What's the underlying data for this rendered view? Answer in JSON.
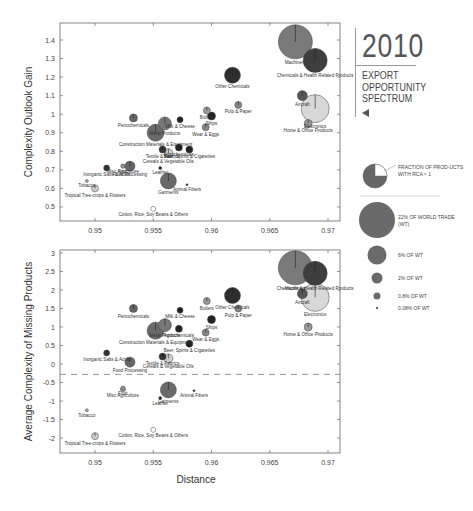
{
  "title": {
    "year": "2010",
    "lines": [
      "EXPORT",
      "OPPORTUNITY",
      "SPECTRUM"
    ]
  },
  "legend": {
    "fraction_label": "FRACTION OF PROD-UCTS WITH RCA > 1",
    "sizes": [
      {
        "label": "22% OF WORLD TRADE (WT)",
        "r": 18
      },
      {
        "label": "6% OF WT",
        "r": 9.5
      },
      {
        "label": "2% OF WT",
        "r": 5.5
      },
      {
        "label": "0.8% OF WT",
        "r": 3.5
      },
      {
        "label": "0.08% OF WT",
        "r": 1.2
      }
    ]
  },
  "chart_data": [
    {
      "type": "scatter",
      "title": "",
      "xlabel": "",
      "ylabel": "Complexity Outlook Gain",
      "xlim": [
        0.948,
        0.9712
      ],
      "ylim": [
        0.42,
        1.5
      ],
      "xticks": [
        "0.95",
        "0.955",
        "0.96",
        "0.965",
        "0.97"
      ],
      "yticks": [
        "0.5",
        "0.6",
        "0.7",
        "0.8",
        "0.9",
        "1",
        "1.1",
        "1.2",
        "1.3",
        "1.4"
      ],
      "points": [
        {
          "name": "Machinery",
          "x": 0.9672,
          "y": 1.39,
          "r": 17,
          "color": "#7a7a7a"
        },
        {
          "name": "Chemicals & Health Related Products",
          "x": 0.9689,
          "y": 1.29,
          "r": 12,
          "color": "#3e3e3e"
        },
        {
          "name": "Other Chemicals",
          "x": 0.9618,
          "y": 1.21,
          "r": 8,
          "color": "#2e2e2e"
        },
        {
          "name": "Aircraft",
          "x": 0.9678,
          "y": 1.1,
          "r": 5,
          "color": "#555"
        },
        {
          "name": "Electronics",
          "x": 0.9689,
          "y": 1.03,
          "r": 14,
          "color": "#d8d8d8"
        },
        {
          "name": "Home & Office Products",
          "x": 0.9683,
          "y": 0.95,
          "r": 4,
          "color": "#999"
        },
        {
          "name": "Pulp & Paper",
          "x": 0.9623,
          "y": 1.05,
          "r": 3.5,
          "color": "#888"
        },
        {
          "name": "Boilers",
          "x": 0.9596,
          "y": 1.02,
          "r": 3.5,
          "color": "#999"
        },
        {
          "name": "Ships",
          "x": 0.96,
          "y": 0.99,
          "r": 4,
          "color": "#222"
        },
        {
          "name": "Wear & Eggs",
          "x": 0.9595,
          "y": 0.93,
          "r": 3.5,
          "color": "#888"
        },
        {
          "name": "Petrochemicals",
          "x": 0.9533,
          "y": 0.98,
          "r": 4,
          "color": "#666"
        },
        {
          "name": "Metal Products",
          "x": 0.956,
          "y": 0.95,
          "r": 6.5,
          "color": "#777"
        },
        {
          "name": "Milk & Cheese",
          "x": 0.9573,
          "y": 0.97,
          "r": 3,
          "color": "#222"
        },
        {
          "name": "Construction Materials & Equipment",
          "x": 0.9552,
          "y": 0.9,
          "r": 8.5,
          "color": "#6a6a6a"
        },
        {
          "name": "Agrochemicals",
          "x": 0.9572,
          "y": 0.82,
          "r": 3.5,
          "color": "#222"
        },
        {
          "name": "Beer, Spirits & Cigarettes",
          "x": 0.9581,
          "y": 0.81,
          "r": 3.5,
          "color": "#222"
        },
        {
          "name": "Textile & Fabrics",
          "x": 0.9558,
          "y": 0.81,
          "r": 3.5,
          "color": "#333"
        },
        {
          "name": "Cereals & Vegetable Oils",
          "x": 0.9563,
          "y": 0.79,
          "r": 4.5,
          "color": "#ccc"
        },
        {
          "name": "Leather",
          "x": 0.9556,
          "y": 0.71,
          "r": 1.5,
          "color": "#222"
        },
        {
          "name": "Misc Agriculture",
          "x": 0.9524,
          "y": 0.72,
          "r": 2,
          "color": "#999"
        },
        {
          "name": "Fruit",
          "x": 0.9524,
          "y": 0.72,
          "r": 2,
          "color": "#999"
        },
        {
          "name": "Food Processing",
          "x": 0.953,
          "y": 0.72,
          "r": 5,
          "color": "#666"
        },
        {
          "name": "Inorganic Salts & Acids",
          "x": 0.951,
          "y": 0.71,
          "r": 3,
          "color": "#333"
        },
        {
          "name": "Tobacco",
          "x": 0.9493,
          "y": 0.64,
          "r": 1.5,
          "color": "#aaa"
        },
        {
          "name": "Garments",
          "x": 0.9563,
          "y": 0.64,
          "r": 8,
          "color": "#6a6a6a"
        },
        {
          "name": "Animal Fibers",
          "x": 0.9579,
          "y": 0.62,
          "r": 1,
          "color": "#222"
        },
        {
          "name": "Tropical Tree-crops & Flowers",
          "x": 0.95,
          "y": 0.6,
          "r": 3.5,
          "color": "#ccc"
        },
        {
          "name": "Cotton, Rice, Soy Beans & Others",
          "x": 0.955,
          "y": 0.49,
          "r": 2.5,
          "color": "#fff"
        }
      ]
    },
    {
      "type": "scatter",
      "title": "",
      "xlabel": "Distance",
      "ylabel": "Average Complexity of Missing Products",
      "xlim": [
        0.948,
        0.9712
      ],
      "ylim": [
        -2.4,
        3
      ],
      "xticks": [
        "0.95",
        "0.955",
        "0.96",
        "0.965",
        "0.97"
      ],
      "yticks": [
        "-2",
        "-1.5",
        "-1",
        "-0.5",
        "0",
        "0.5",
        "1",
        "1.5",
        "2",
        "2.5",
        "3"
      ],
      "reference_line_y": -0.28,
      "points": [
        {
          "name": "Machinery",
          "x": 0.9672,
          "y": 2.6,
          "r": 17,
          "color": "#7a7a7a"
        },
        {
          "name": "Chemicals & Health Related Products",
          "x": 0.9689,
          "y": 2.45,
          "r": 12,
          "color": "#3e3e3e"
        },
        {
          "name": "Aircraft",
          "x": 0.9678,
          "y": 1.9,
          "r": 5,
          "color": "#555"
        },
        {
          "name": "Electronics",
          "x": 0.9689,
          "y": 1.8,
          "r": 14,
          "color": "#d8d8d8"
        },
        {
          "name": "Home & Office Products",
          "x": 0.9683,
          "y": 1.0,
          "r": 4,
          "color": "#999"
        },
        {
          "name": "Other Chemicals",
          "x": 0.9618,
          "y": 1.85,
          "r": 8,
          "color": "#2e2e2e"
        },
        {
          "name": "Boilers",
          "x": 0.9596,
          "y": 1.7,
          "r": 3.5,
          "color": "#999"
        },
        {
          "name": "Pulp & Paper",
          "x": 0.9623,
          "y": 1.5,
          "r": 3.5,
          "color": "#888"
        },
        {
          "name": "Petrochemicals",
          "x": 0.9533,
          "y": 1.5,
          "r": 4,
          "color": "#666"
        },
        {
          "name": "Milk & Cheese",
          "x": 0.9573,
          "y": 1.45,
          "r": 3,
          "color": "#222"
        },
        {
          "name": "Metal Products",
          "x": 0.956,
          "y": 1.05,
          "r": 6.5,
          "color": "#777"
        },
        {
          "name": "Ships",
          "x": 0.96,
          "y": 1.2,
          "r": 4,
          "color": "#222"
        },
        {
          "name": "Agrochemicals",
          "x": 0.9572,
          "y": 0.95,
          "r": 3.5,
          "color": "#222"
        },
        {
          "name": "Wear & Eggs",
          "x": 0.9595,
          "y": 0.85,
          "r": 3.5,
          "color": "#888"
        },
        {
          "name": "Construction Materials & Equipment",
          "x": 0.9552,
          "y": 0.9,
          "r": 8.5,
          "color": "#6a6a6a"
        },
        {
          "name": "Beer, Spirits & Cigarettes",
          "x": 0.9581,
          "y": 0.55,
          "r": 3.5,
          "color": "#222"
        },
        {
          "name": "Textile & Fabrics",
          "x": 0.9558,
          "y": 0.2,
          "r": 3.5,
          "color": "#333"
        },
        {
          "name": "Cereals & Vegetable Oils",
          "x": 0.9563,
          "y": 0.15,
          "r": 4.5,
          "color": "#ccc"
        },
        {
          "name": "Inorganic Salts & Acids",
          "x": 0.951,
          "y": 0.3,
          "r": 3,
          "color": "#333"
        },
        {
          "name": "Food Processing",
          "x": 0.953,
          "y": 0.05,
          "r": 5,
          "color": "#666"
        },
        {
          "name": "Fruit",
          "x": 0.9524,
          "y": -0.65,
          "r": 2,
          "color": "#999"
        },
        {
          "name": "Misc Agriculture",
          "x": 0.9524,
          "y": -0.68,
          "r": 2.5,
          "color": "#999"
        },
        {
          "name": "Garments",
          "x": 0.9563,
          "y": -0.7,
          "r": 8,
          "color": "#6a6a6a"
        },
        {
          "name": "Leather",
          "x": 0.9556,
          "y": -0.92,
          "r": 1.5,
          "color": "#222"
        },
        {
          "name": "Animal Fibers",
          "x": 0.9585,
          "y": -0.72,
          "r": 1,
          "color": "#222"
        },
        {
          "name": "Tobacco",
          "x": 0.9493,
          "y": -1.25,
          "r": 1.5,
          "color": "#aaa"
        },
        {
          "name": "Tropical Tree-crops & Flowers",
          "x": 0.95,
          "y": -1.95,
          "r": 3.5,
          "color": "#ccc"
        },
        {
          "name": "Cotton, Rice, Soy Beans & Others",
          "x": 0.955,
          "y": -1.78,
          "r": 2.5,
          "color": "#fff"
        }
      ]
    }
  ]
}
